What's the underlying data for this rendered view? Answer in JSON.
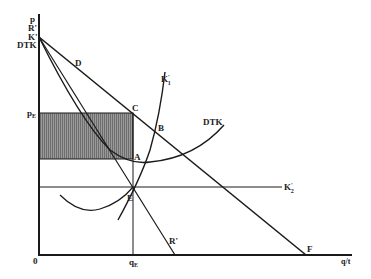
{
  "diagram": {
    "type": "economics-diagram",
    "axes": {
      "y_labels": [
        "p",
        "R'",
        "K'",
        "DTK"
      ],
      "x_label": "q/t",
      "origin_label": "0"
    },
    "points": {
      "D": "D",
      "C": "C",
      "B": "B",
      "A": "A",
      "E": "E",
      "F": "F"
    },
    "curves": {
      "K1": "K",
      "K1_sup": "'",
      "K1_sub": "1",
      "K2": "K",
      "K2_sup": "'",
      "K2_sub": "2",
      "DTK": "DTK",
      "R": "R'"
    },
    "ticks": {
      "pE": "p",
      "pE_sub": "E",
      "qE": "q",
      "qE_sub": "E"
    },
    "colors": {
      "line": "#1a1a1a",
      "shade": "#8c8c8c",
      "background": "#ffffff"
    }
  }
}
